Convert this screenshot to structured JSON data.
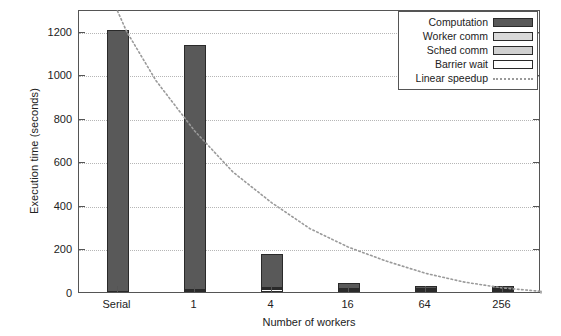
{
  "chart_data": {
    "type": "bar",
    "title": "",
    "xlabel": "Number of workers",
    "ylabel": "Execution time (seconds)",
    "categories": [
      "Serial",
      "1",
      "4",
      "16",
      "64",
      "256"
    ],
    "ylim": [
      0,
      1300
    ],
    "yticks": [
      0,
      200,
      400,
      600,
      800,
      1000,
      1200
    ],
    "ytick_labels": [
      "0",
      "200",
      "400",
      "600",
      "800",
      "1000",
      "1200"
    ],
    "grid": true,
    "stacked": true,
    "legend_position": "top-right",
    "series": [
      {
        "name": "Computation",
        "color": "#595959",
        "values": [
          1205,
          1120,
          148,
          22,
          8,
          6
        ]
      },
      {
        "name": "Worker comm",
        "color": "#d9d9d9",
        "values": [
          0,
          4,
          3,
          1,
          1,
          1
        ]
      },
      {
        "name": "Sched comm",
        "color": "#d0d0d0",
        "values": [
          0,
          2,
          2,
          1,
          1,
          1
        ]
      },
      {
        "name": "Barrier wait",
        "color": "#ffffff",
        "values": [
          0,
          0,
          14,
          2,
          1,
          1
        ]
      }
    ],
    "totals": [
      1205,
      1126,
      167,
      26,
      11,
      9
    ],
    "reference_line": {
      "name": "Linear speedup",
      "style": "dotted",
      "color": "#9a9a9a",
      "points": [
        {
          "x": 1.0,
          "y": 1300
        },
        {
          "x": 1.12,
          "y": 1205
        },
        {
          "x": 1.5,
          "y": 980
        },
        {
          "x": 2.0,
          "y": 750
        },
        {
          "x": 2.5,
          "y": 560
        },
        {
          "x": 3.0,
          "y": 420
        },
        {
          "x": 3.5,
          "y": 300
        },
        {
          "x": 4.0,
          "y": 215
        },
        {
          "x": 4.5,
          "y": 150
        },
        {
          "x": 5.0,
          "y": 95
        },
        {
          "x": 5.5,
          "y": 55
        },
        {
          "x": 6.0,
          "y": 28
        },
        {
          "x": 6.5,
          "y": 12
        }
      ]
    }
  },
  "legend": {
    "items": [
      {
        "label": "Computation",
        "swatch": "computation-swatch"
      },
      {
        "label": "Worker comm",
        "swatch": "worker-comm-swatch"
      },
      {
        "label": "Sched comm",
        "swatch": "sched-comm-swatch"
      },
      {
        "label": "Barrier wait",
        "swatch": "barrier-wait-swatch"
      },
      {
        "label": "Linear speedup",
        "swatch": "linear-speedup-line"
      }
    ]
  },
  "axes": {
    "y_title": "Execution time (seconds)",
    "x_title": "Number of workers"
  },
  "colors": {
    "computation": "#595959",
    "worker_comm": "#d9d9d9",
    "sched_comm": "#d0d0d0",
    "barrier_wait": "#ffffff",
    "linear_speedup": "#9a9a9a",
    "frame": "#555555",
    "grid": "#b6b6b6"
  }
}
